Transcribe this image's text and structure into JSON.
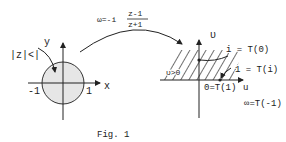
{
  "figure": {
    "caption": "Fig. 1",
    "mapping": {
      "lhs": "ω=-i",
      "numerator": "z-1",
      "denominator": "z+1"
    },
    "left_plane": {
      "region_label": "|z|<|",
      "x_axis": "x",
      "y_axis": "y",
      "tick_neg": "-1",
      "tick_pos": "1"
    },
    "right_plane": {
      "u_axis": "u",
      "v_axis": "υ",
      "region_label": "υ>0",
      "point_i": "i = T(0)",
      "point_1": "1 = T(i)",
      "point_0": "0=T(1)",
      "point_inf": "∞=T(-1)"
    }
  }
}
